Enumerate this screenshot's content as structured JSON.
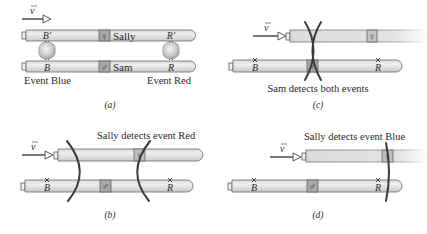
{
  "figure": {
    "velocity_symbol": "v",
    "panels": {
      "a": {
        "caption": "(a)",
        "sally_label": "Sally",
        "sam_label": "Sam",
        "sally_symbol": "♀",
        "sam_symbol": "♂",
        "mark_b_prime": "B′",
        "mark_r_prime": "R′",
        "mark_b": "B",
        "mark_r": "R",
        "event_blue": "Event Blue",
        "event_red": "Event Red"
      },
      "b": {
        "caption": "(b)",
        "title": "Sally detects event Red",
        "sally_symbol": "♀",
        "sam_symbol": "♂",
        "mark_b": "B",
        "mark_r": "R"
      },
      "c": {
        "caption": "(c)",
        "title": "Sam detects both events",
        "sally_symbol": "♀",
        "sam_symbol": "♂",
        "mark_b": "B",
        "mark_r": "R"
      },
      "d": {
        "caption": "(d)",
        "title": "Sally detects event Blue",
        "sally_symbol": "♀",
        "sam_symbol": "♂",
        "mark_b": "B",
        "mark_r": "R"
      }
    },
    "colors": {
      "rod_light": "#eeeeee",
      "rod_dark": "#cfcfcf",
      "observer_box": "#a8a8a8",
      "wavefront": "#3c3c3c",
      "text": "#2a2a2a"
    }
  }
}
